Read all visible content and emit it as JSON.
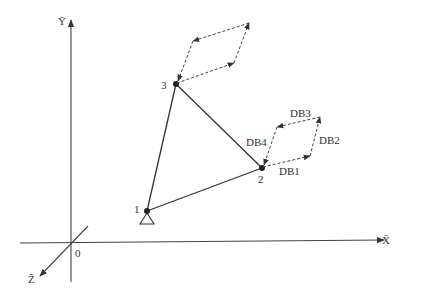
{
  "axes": {
    "x_label": "X̄",
    "y_label": "Ȳ",
    "z_label": "Z̄",
    "origin_label": "0"
  },
  "nodes": [
    {
      "id": "1",
      "label": "1",
      "x": 147,
      "y": 211,
      "support": "pin"
    },
    {
      "id": "2",
      "label": "2",
      "x": 262,
      "y": 168
    },
    {
      "id": "3",
      "label": "3",
      "x": 176,
      "y": 84
    }
  ],
  "members": [
    {
      "from": "1",
      "to": "2"
    },
    {
      "from": "1",
      "to": "3"
    },
    {
      "from": "3",
      "to": "2"
    }
  ],
  "dof_labels": {
    "db1": "DB1",
    "db2": "DB2",
    "db3": "DB3",
    "db4": "DB4"
  },
  "colors": {
    "line": "#333333",
    "background": "#ffffff"
  }
}
